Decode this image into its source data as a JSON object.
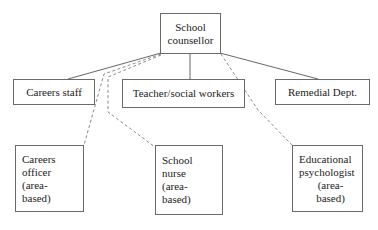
{
  "diagram": {
    "type": "organisational-hierarchy",
    "colors": {
      "background": "#ffffff",
      "box_border": "#6a6a68",
      "text": "#1c1c1c",
      "solid_edge": "#55555a",
      "dashed_edge": "#7e7e86"
    },
    "nodes": [
      {
        "id": "root",
        "name": "school-counsellor",
        "lines": [
          "School",
          "counsellor"
        ],
        "align": "center",
        "level": 0
      },
      {
        "id": "careers_staff",
        "name": "careers-staff",
        "lines": [
          "Careers staff"
        ],
        "align": "center",
        "level": 1
      },
      {
        "id": "teacher_social_workers",
        "name": "teacher-social-workers",
        "lines": [
          "Teacher/social workers"
        ],
        "align": "center",
        "level": 1
      },
      {
        "id": "remedial_dept",
        "name": "remedial-dept",
        "lines": [
          "Remedial Dept."
        ],
        "align": "center",
        "level": 1
      },
      {
        "id": "careers_officer",
        "name": "careers-officer",
        "lines": [
          "Careers",
          "officer",
          "(area-",
          "based)"
        ],
        "align": "left",
        "level": 2
      },
      {
        "id": "school_nurse",
        "name": "school-nurse",
        "lines": [
          "School",
          "nurse",
          "(area-",
          "based)"
        ],
        "align": "left",
        "level": 2
      },
      {
        "id": "educational_psychologist",
        "name": "educational-psychologist",
        "lines": [
          "Educational",
          "psychologist",
          "(area-",
          "based)"
        ],
        "align": "left-centered-tail",
        "level": 2
      }
    ],
    "edges": [
      {
        "from": "root",
        "to": "careers_staff",
        "style": "solid"
      },
      {
        "from": "root",
        "to": "teacher_social_workers",
        "style": "solid"
      },
      {
        "from": "root",
        "to": "remedial_dept",
        "style": "solid"
      },
      {
        "from": "root",
        "to": "careers_officer",
        "style": "dashed"
      },
      {
        "from": "root",
        "to": "school_nurse",
        "style": "dashed"
      },
      {
        "from": "root",
        "to": "educational_psychologist",
        "style": "dashed"
      }
    ]
  }
}
